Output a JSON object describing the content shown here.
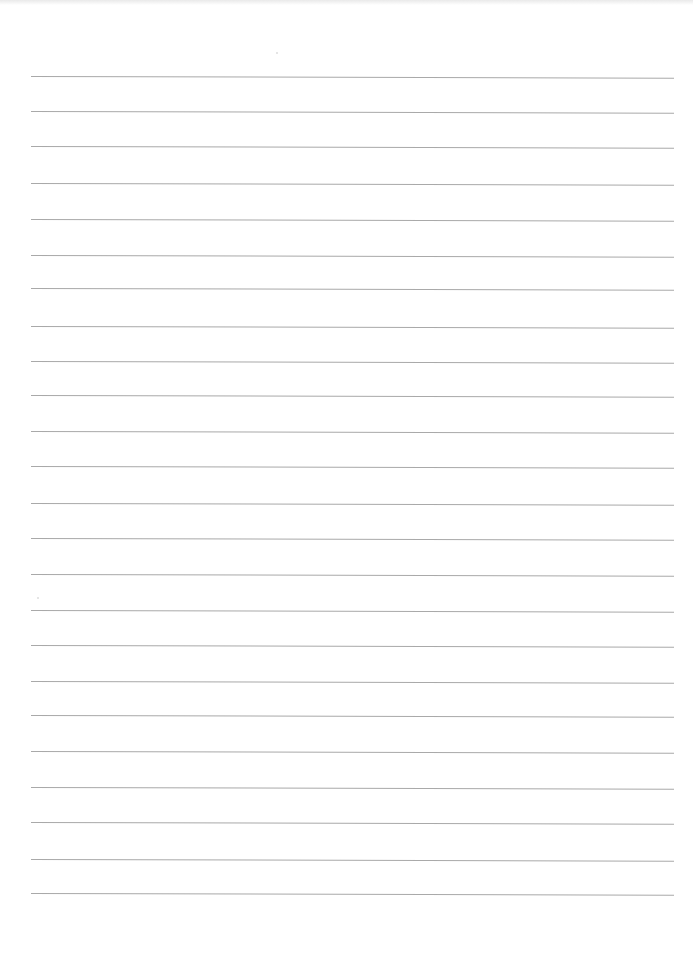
{
  "document": {
    "type": "lined-paper",
    "text": "",
    "colors": {
      "paper": "#ffffff",
      "rule": "#a9a9a9",
      "scan_shadow": "#e9e9e9"
    },
    "rules": {
      "count": 24,
      "x_start": 31,
      "x_end": 674,
      "thickness": 1,
      "y_positions": [
        77,
        112,
        147,
        184,
        220,
        256,
        289,
        327,
        362,
        396,
        432,
        467,
        504,
        539,
        575,
        611,
        646,
        682,
        716,
        752,
        788,
        823,
        860,
        894
      ],
      "tilt_deg": 0.15
    }
  }
}
